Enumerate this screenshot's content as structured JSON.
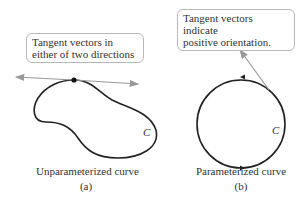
{
  "panels": [
    {
      "id": "a",
      "callout": [
        "Tangent vectors in",
        "either of two directions"
      ],
      "curve_label": "C",
      "caption": "Unparameterized curve",
      "sublabel": "(a)"
    },
    {
      "id": "b",
      "callout": [
        "Tangent vectors indicate",
        "positive orientation."
      ],
      "curve_label": "C",
      "caption": "Parameterized curve",
      "sublabel": "(b)"
    }
  ],
  "colors": {
    "curve": "#222222",
    "tangent": "#999999",
    "callout_border": "#b8b8b8",
    "text": "#333333"
  }
}
